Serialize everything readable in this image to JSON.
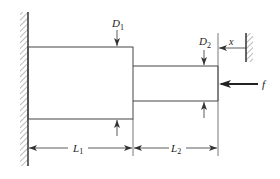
{
  "diagram": {
    "type": "stepped-bar-mechanics",
    "labels": {
      "D1": {
        "main": "D",
        "sub": "1"
      },
      "D2": {
        "main": "D",
        "sub": "2"
      },
      "L1": {
        "main": "L",
        "sub": "1"
      },
      "L2": {
        "main": "L",
        "sub": "2"
      },
      "x": "x",
      "f": "f"
    },
    "colors": {
      "line": "#333333",
      "hatch": "#666666",
      "background": "#ffffff"
    }
  }
}
